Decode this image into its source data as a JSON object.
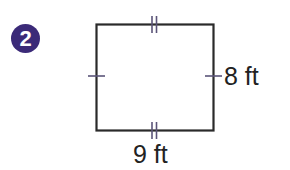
{
  "problem": {
    "number": "2",
    "badge_color": "#3b2a78"
  },
  "figure": {
    "shape": "rectangle",
    "stroke_color": "#2a2a2a",
    "tick_color": "#5b5478",
    "sides": {
      "height_label": "8 ft",
      "width_label": "9 ft"
    },
    "congruence_marks": {
      "top": "double",
      "bottom": "double",
      "left": "single",
      "right": "single"
    }
  }
}
